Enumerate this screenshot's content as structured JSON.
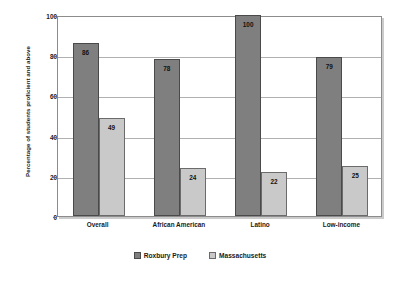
{
  "chart_data": {
    "type": "bar",
    "title": "",
    "subtitle": "",
    "xlabel": "",
    "ylabel": "Percentage of students proficient and above",
    "ylim": [
      0,
      100
    ],
    "yticks": [
      0,
      20,
      40,
      60,
      80,
      100
    ],
    "ytick_labels": [
      "0",
      "20",
      "40",
      "60",
      "80",
      "100"
    ],
    "grid": true,
    "grid_axis": "y",
    "legend_position": "bottom-center",
    "categories": [
      "Overall",
      "African American",
      "Latino",
      "Low-income"
    ],
    "series": [
      {
        "name": "Roxbury Prep",
        "color": "#7f7f7f",
        "values": [
          86,
          78,
          100,
          79
        ],
        "value_labels": [
          "86",
          "78",
          "100",
          "79"
        ]
      },
      {
        "name": "Massachusetts",
        "color": "#c9c9c9",
        "values": [
          49,
          24,
          22,
          25
        ],
        "value_labels": [
          "49",
          "24",
          "22",
          "25"
        ]
      }
    ]
  },
  "legend": {
    "items": [
      {
        "label": "Roxbury Prep",
        "swatch": "dark-gray-swatch"
      },
      {
        "label": "Massachusetts",
        "swatch": "light-gray-swatch"
      }
    ]
  },
  "colors": {
    "series_0": "#7f7f7f",
    "series_1": "#c9c9c9",
    "grid": "#b0b0b0",
    "frame": "#8c8c8c",
    "text": "#1a1a1a",
    "background": "#ffffff"
  }
}
